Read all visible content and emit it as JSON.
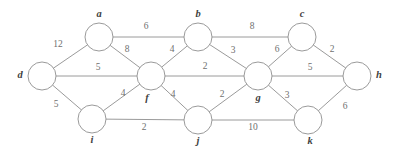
{
  "figure": {
    "type": "undirected-weighted-graph",
    "width": 397,
    "height": 155,
    "background_color": "#ffffff",
    "edge_color": "#8e8e8e",
    "node_fill_color": "#ffffff",
    "node_stroke_color": "#8e8e8e",
    "label_color": "#3f3f3f",
    "weight_color": "#6f6f6f",
    "node_radius": 14
  },
  "chart_data": {
    "type": "diagram",
    "title": "",
    "nodes": [
      {
        "id": "a",
        "label": "a",
        "x": 99,
        "y": 37,
        "label_x": 99,
        "label_y": 15
      },
      {
        "id": "b",
        "label": "b",
        "x": 198,
        "y": 37,
        "label_x": 198,
        "label_y": 15
      },
      {
        "id": "c",
        "label": "c",
        "x": 302,
        "y": 37,
        "label_x": 302,
        "label_y": 15
      },
      {
        "id": "d",
        "label": "d",
        "x": 42,
        "y": 76,
        "label_x": 20,
        "label_y": 76
      },
      {
        "id": "f",
        "label": "f",
        "x": 151,
        "y": 76,
        "label_x": 147,
        "label_y": 99
      },
      {
        "id": "g",
        "label": "g",
        "x": 258,
        "y": 76,
        "label_x": 258,
        "label_y": 99
      },
      {
        "id": "h",
        "label": "h",
        "x": 357,
        "y": 76,
        "label_x": 379,
        "label_y": 76
      },
      {
        "id": "i",
        "label": "i",
        "x": 92,
        "y": 119,
        "label_x": 92,
        "label_y": 141
      },
      {
        "id": "j",
        "label": "j",
        "x": 198,
        "y": 120,
        "label_x": 198,
        "label_y": 142
      },
      {
        "id": "k",
        "label": "k",
        "x": 308,
        "y": 120,
        "label_x": 310,
        "label_y": 142
      }
    ],
    "edges": [
      {
        "source": "d",
        "target": "a",
        "weight": 12,
        "label_x": 58,
        "label_y": 45
      },
      {
        "source": "a",
        "target": "b",
        "weight": 6,
        "label_x": 146,
        "label_y": 27
      },
      {
        "source": "b",
        "target": "c",
        "weight": 8,
        "label_x": 252,
        "label_y": 27
      },
      {
        "source": "a",
        "target": "f",
        "weight": 8,
        "label_x": 127,
        "label_y": 50
      },
      {
        "source": "b",
        "target": "f",
        "weight": 4,
        "label_x": 172,
        "label_y": 50
      },
      {
        "source": "b",
        "target": "g",
        "weight": 3,
        "label_x": 233,
        "label_y": 51
      },
      {
        "source": "c",
        "target": "g",
        "weight": 6,
        "label_x": 277,
        "label_y": 50
      },
      {
        "source": "c",
        "target": "h",
        "weight": 2,
        "label_x": 332,
        "label_y": 50
      },
      {
        "source": "d",
        "target": "f",
        "weight": 5,
        "label_x": 98,
        "label_y": 68
      },
      {
        "source": "f",
        "target": "g",
        "weight": 2,
        "label_x": 205,
        "label_y": 67
      },
      {
        "source": "g",
        "target": "h",
        "weight": 5,
        "label_x": 310,
        "label_y": 68
      },
      {
        "source": "d",
        "target": "i",
        "weight": 5,
        "label_x": 56,
        "label_y": 105
      },
      {
        "source": "i",
        "target": "f",
        "weight": 4,
        "label_x": 123,
        "label_y": 94
      },
      {
        "source": "f",
        "target": "j",
        "weight": 4,
        "label_x": 173,
        "label_y": 95
      },
      {
        "source": "j",
        "target": "g",
        "weight": 2,
        "label_x": 222,
        "label_y": 95
      },
      {
        "source": "g",
        "target": "k",
        "weight": 3,
        "label_x": 287,
        "label_y": 96
      },
      {
        "source": "i",
        "target": "j",
        "weight": 2,
        "label_x": 144,
        "label_y": 128
      },
      {
        "source": "j",
        "target": "k",
        "weight": 10,
        "label_x": 253,
        "label_y": 128
      },
      {
        "source": "k",
        "target": "h",
        "weight": 6,
        "label_x": 345,
        "label_y": 107
      }
    ]
  }
}
